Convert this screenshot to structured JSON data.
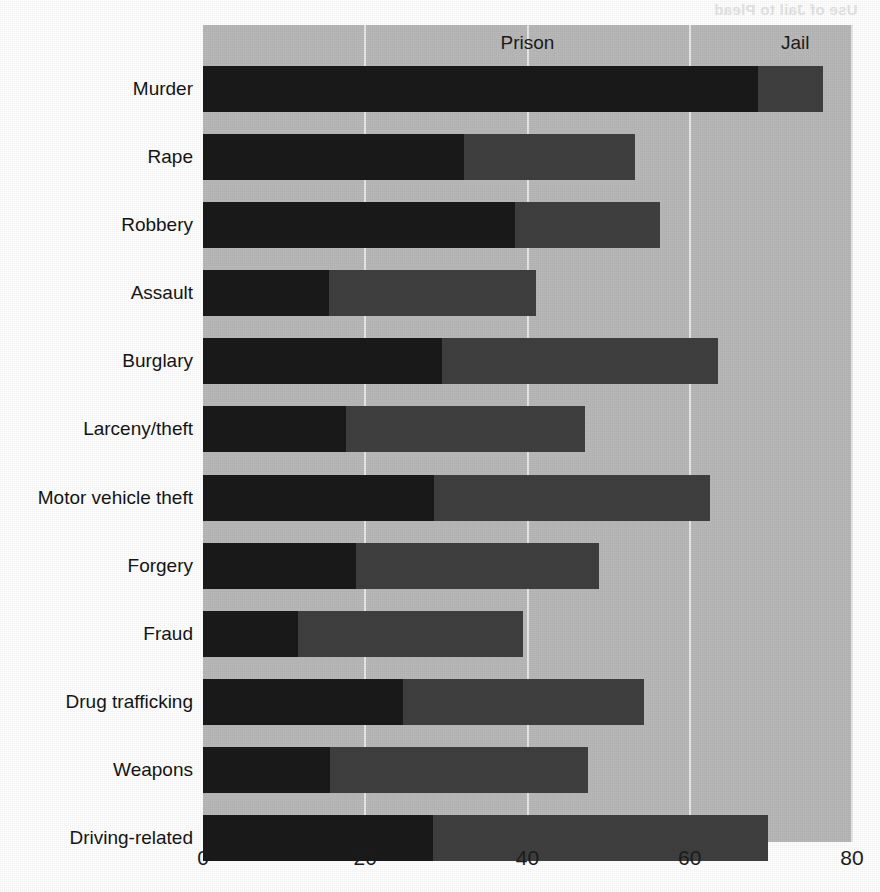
{
  "artifact": {
    "bleed_through_text": "Use of Jail to Plead"
  },
  "chart_data": {
    "type": "bar",
    "orientation": "horizontal",
    "stacked": true,
    "title": "",
    "xlabel": "",
    "ylabel": "",
    "xlim": [
      0,
      80
    ],
    "xticks": [
      0,
      20,
      40,
      60,
      80
    ],
    "xtick_labels": [
      "0",
      "20",
      "40",
      "60",
      "80"
    ],
    "grid": "vertical",
    "legend_position": "top-inside",
    "annotations": [
      {
        "label": "Prison",
        "x": 40
      },
      {
        "label": "Jail",
        "x": 73
      }
    ],
    "categories": [
      "Murder",
      "Rape",
      "Robbery",
      "Assault",
      "Burglary",
      "Larceny/theft",
      "Motor vehicle theft",
      "Forgery",
      "Fraud",
      "Drug trafficking",
      "Weapons",
      "Driving-related"
    ],
    "series": [
      {
        "name": "Prison",
        "color": "#1a1a1a",
        "values": [
          68.4,
          32.2,
          38.5,
          15.5,
          29.4,
          17.6,
          28.5,
          18.9,
          11.7,
          24.7,
          15.7,
          28.3
        ]
      },
      {
        "name": "Jail",
        "color": "#3f3f3f",
        "values": [
          8.0,
          21.1,
          17.8,
          25.6,
          34.1,
          29.5,
          34.0,
          29.9,
          27.8,
          29.6,
          31.8,
          41.4
        ]
      }
    ],
    "totals": [
      76.4,
      53.3,
      56.3,
      41.1,
      63.5,
      47.1,
      62.5,
      48.8,
      39.5,
      54.3,
      47.5,
      69.7
    ],
    "colors": {
      "plot_background": "#b9b9b9",
      "gridline": "#e8e8e8",
      "prison": "#1a1a1a",
      "jail": "#3f3f3f",
      "text": "#1c1c1c"
    }
  }
}
